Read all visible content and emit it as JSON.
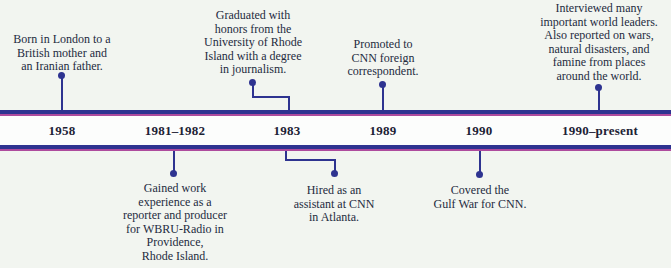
{
  "diagram": {
    "colors": {
      "background": "#f2f5f0",
      "band": "#fcfdfc",
      "bar-navy": "#2e3390",
      "bar-magenta": "#ae4b9d",
      "connector": "#2e3390",
      "text": "#242b3e",
      "year-text": "#1c2235"
    },
    "years": [
      {
        "label": "1958"
      },
      {
        "label": "1981–1982"
      },
      {
        "label": "1983"
      },
      {
        "label": "1989"
      },
      {
        "label": "1990"
      },
      {
        "label": "1990–present"
      }
    ],
    "events_above": [
      {
        "year": "1958",
        "text": "Born in London to a\nBritish mother and\nan Iranian father."
      },
      {
        "year": "1983",
        "text": "Graduated with\nhonors from the\nUniversity of Rhode\nIsland with a degree\nin journalism."
      },
      {
        "year": "1989",
        "text": "Promoted to\nCNN foreign\ncorrespondent."
      },
      {
        "year": "1990–present",
        "text": "Interviewed many\nimportant world leaders.\nAlso reported on wars,\nnatural disasters, and\nfamine from places\naround the world."
      }
    ],
    "events_below": [
      {
        "year": "1981–1982",
        "text": "Gained work\nexperience as a\nreporter and producer\nfor WBRU-Radio in\nProvidence,\nRhode Island."
      },
      {
        "year": "1983",
        "text": "Hired as an\nassistant at CNN\nin Atlanta."
      },
      {
        "year": "1990",
        "text": "Covered the\nGulf War for CNN."
      }
    ]
  }
}
